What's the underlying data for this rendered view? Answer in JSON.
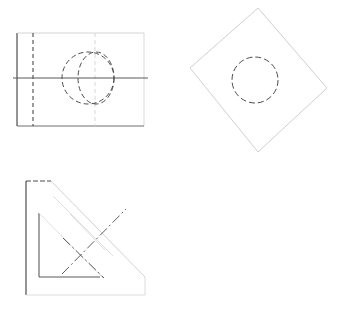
{
  "document": {
    "title": "Orthographic Projection Drawing",
    "background_color": "#ffffff",
    "canvas_width": 349,
    "canvas_height": 314
  },
  "styles": {
    "visible_line_color": "#4d4d4d",
    "faint_line_color": "#c8c8c8",
    "hidden_line_color": "#555555",
    "center_line_color": "#666666",
    "visible_line_width": 1.1,
    "faint_line_width": 0.8,
    "hidden_dash": "4,3",
    "center_dash": "7,2,1.5,2"
  },
  "views": [
    {
      "id": "front-view",
      "name": "Front View",
      "outline": {
        "shape": "rectangle",
        "x": 17,
        "y": 33,
        "width": 127,
        "height": 93,
        "edges": {
          "left": {
            "x1": 17,
            "y1": 33,
            "x2": 17,
            "y2": 126,
            "weight": "visible"
          },
          "top": {
            "x1": 17,
            "y1": 33,
            "x2": 144,
            "y2": 33,
            "weight": "faint"
          },
          "right": {
            "x1": 144,
            "y1": 33,
            "x2": 144,
            "y2": 126,
            "weight": "faint"
          },
          "bottom": {
            "x1": 17,
            "y1": 126,
            "x2": 144,
            "y2": 126,
            "weight": "visible"
          }
        }
      },
      "hidden_lines": [
        {
          "id": "hidden-vertical-left",
          "x1": 33,
          "y1": 33,
          "x2": 33,
          "y2": 126
        },
        {
          "id": "hidden-vertical-mid",
          "x1": 95,
          "y1": 33,
          "x2": 95,
          "y2": 126,
          "weight": "faint"
        }
      ],
      "center_lines": [
        {
          "id": "horizontal-centerline",
          "x1": 13,
          "y1": 78,
          "x2": 148,
          "y2": 78
        }
      ],
      "circles": [
        {
          "id": "hidden-circle-left",
          "cx": 88,
          "cy": 78,
          "r": 26,
          "style": "hidden"
        },
        {
          "id": "hidden-circle-right",
          "cx": 96,
          "cy": 78,
          "rx": 18,
          "ry": 26,
          "style": "hidden"
        }
      ]
    },
    {
      "id": "auxiliary-view",
      "name": "Auxiliary Rotated View",
      "outline": {
        "shape": "rotated-square",
        "vertices": [
          {
            "x": 258,
            "y": 8
          },
          {
            "x": 327,
            "y": 88
          },
          {
            "x": 258,
            "y": 152
          },
          {
            "x": 190,
            "y": 68
          }
        ],
        "weight": "faint"
      },
      "circles": [
        {
          "id": "hidden-circle-center",
          "cx": 255,
          "cy": 80,
          "r": 23,
          "style": "hidden"
        }
      ]
    },
    {
      "id": "side-view",
      "name": "Side / Profile View",
      "outline": {
        "shape": "chamfered-L",
        "points": [
          {
            "x": 26,
            "y": 181
          },
          {
            "x": 51,
            "y": 181
          },
          {
            "x": 145,
            "y": 277
          },
          {
            "x": 145,
            "y": 295
          },
          {
            "x": 26,
            "y": 295
          }
        ],
        "weight": "mixed"
      },
      "edges": [
        {
          "id": "outer-left-edge",
          "x1": 26,
          "y1": 181,
          "x2": 26,
          "y2": 295,
          "weight": "visible"
        },
        {
          "id": "outer-top-edge",
          "x1": 26,
          "y1": 181,
          "x2": 51,
          "y2": 181,
          "weight": "visible"
        },
        {
          "id": "chamfer-edge",
          "x1": 51,
          "y1": 181,
          "x2": 145,
          "y2": 277,
          "weight": "faint"
        },
        {
          "id": "outer-right-edge",
          "x1": 145,
          "y1": 277,
          "x2": 145,
          "y2": 295,
          "weight": "faint"
        },
        {
          "id": "outer-bottom-edge",
          "x1": 26,
          "y1": 295,
          "x2": 145,
          "y2": 295,
          "weight": "faint"
        }
      ],
      "inner_profile": [
        {
          "id": "inner-left-edge",
          "x1": 39,
          "y1": 213,
          "x2": 39,
          "y2": 277,
          "weight": "visible"
        },
        {
          "id": "inner-bottom-edge",
          "x1": 39,
          "y1": 277,
          "x2": 100,
          "y2": 277,
          "weight": "visible"
        },
        {
          "id": "inner-chamfer-edge",
          "x1": 39,
          "y1": 213,
          "x2": 103,
          "y2": 278,
          "weight": "faint"
        }
      ],
      "slot_lines": [
        {
          "id": "slot-edge-upper",
          "x1": 53,
          "y1": 196,
          "x2": 113,
          "y2": 256,
          "weight": "faint"
        },
        {
          "id": "slot-edge-lower",
          "x1": 70,
          "y1": 214,
          "x2": 105,
          "y2": 250,
          "weight": "faint"
        }
      ],
      "center_lines": [
        {
          "id": "slot-centerline-diagonal",
          "x1": 62,
          "y1": 274,
          "x2": 126,
          "y2": 209
        },
        {
          "id": "slot-centerline-cross",
          "x1": 63,
          "y1": 238,
          "x2": 104,
          "y2": 278
        }
      ]
    }
  ]
}
